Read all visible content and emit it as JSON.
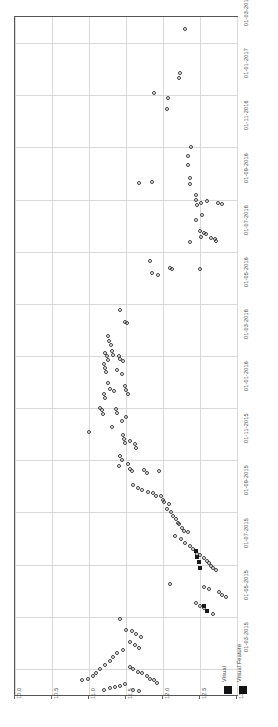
{
  "chart_data": {
    "type": "scatter",
    "title": "",
    "subtitle": "",
    "orientation": "rotated-90",
    "xlabel": "",
    "ylabel": "",
    "grid": true,
    "legend_position": "bottom-right",
    "value_axis": {
      "name": "value",
      "lim": [
        10.0,
        13.0
      ],
      "ticks": [
        10.0,
        10.5,
        11.0,
        11.5,
        12.0,
        12.5,
        13.0
      ],
      "tick_labels": [
        "10.0",
        "10.5",
        "11.0",
        "11.5",
        "12.0",
        "12.5",
        "13.0"
      ]
    },
    "date_axis": {
      "name": "date",
      "lim": [
        "01-02-2015",
        "01-04-2017"
      ],
      "ticks": [
        "01-03-2015",
        "01-05-2015",
        "01-07-2015",
        "01-09-2015",
        "01-11-2015",
        "01-01-2016",
        "01-03-2016",
        "01-05-2016",
        "01-07-2016",
        "01-09-2016",
        "01-11-2016",
        "01-01-2017",
        "01-03-2017"
      ],
      "tick_labels": [
        "01-03-2015",
        "01-05-2015",
        "01-07-2015",
        "01-09-2015",
        "01-11-2015",
        "01-01-2016",
        "01-03-2016",
        "01-05-2016",
        "01-07-2016",
        "01-09-2016",
        "01-11-2016",
        "01-01-2017",
        "01-03-2017"
      ]
    },
    "legend": [
      {
        "name": "Visual",
        "marker": "square",
        "color": "#121212"
      },
      {
        "name": "Visual Feature",
        "marker": "square",
        "color": "#121212"
      }
    ],
    "series": [
      {
        "name": "Visual",
        "marker": "open-circle",
        "color": "#3c3c3c",
        "points": [
          [
            12.3,
            0.018
          ],
          [
            12.23,
            0.082
          ],
          [
            12.22,
            0.09
          ],
          [
            11.88,
            0.112
          ],
          [
            12.07,
            0.12
          ],
          [
            12.05,
            0.135
          ],
          [
            12.38,
            0.192
          ],
          [
            12.34,
            0.205
          ],
          [
            12.34,
            0.218
          ],
          [
            12.37,
            0.238
          ],
          [
            12.37,
            0.246
          ],
          [
            11.68,
            0.245
          ],
          [
            11.85,
            0.244
          ],
          [
            12.45,
            0.262
          ],
          [
            12.44,
            0.27
          ],
          [
            12.46,
            0.278
          ],
          [
            12.52,
            0.275
          ],
          [
            12.59,
            0.272
          ],
          [
            12.74,
            0.274
          ],
          [
            12.8,
            0.276
          ],
          [
            12.53,
            0.292
          ],
          [
            12.45,
            0.3
          ],
          [
            12.5,
            0.316
          ],
          [
            12.52,
            0.324
          ],
          [
            12.55,
            0.318
          ],
          [
            12.58,
            0.32
          ],
          [
            12.65,
            0.326
          ],
          [
            12.7,
            0.328
          ],
          [
            12.71,
            0.33
          ],
          [
            12.37,
            0.332
          ],
          [
            11.83,
            0.36
          ],
          [
            11.85,
            0.378
          ],
          [
            11.93,
            0.38
          ],
          [
            12.09,
            0.37
          ],
          [
            12.12,
            0.372
          ],
          [
            12.5,
            0.372
          ],
          [
            11.42,
            0.432
          ],
          [
            11.48,
            0.45
          ],
          [
            11.52,
            0.452
          ],
          [
            11.25,
            0.47
          ],
          [
            11.27,
            0.478
          ],
          [
            11.3,
            0.484
          ],
          [
            11.22,
            0.496
          ],
          [
            11.24,
            0.5
          ],
          [
            11.25,
            0.506
          ],
          [
            11.2,
            0.512
          ],
          [
            11.21,
            0.518
          ],
          [
            11.23,
            0.524
          ],
          [
            11.31,
            0.492
          ],
          [
            11.33,
            0.498
          ],
          [
            11.4,
            0.5
          ],
          [
            11.42,
            0.505
          ],
          [
            11.46,
            0.508
          ],
          [
            11.38,
            0.52
          ],
          [
            11.44,
            0.526
          ],
          [
            11.26,
            0.54
          ],
          [
            11.28,
            0.548
          ],
          [
            11.34,
            0.552
          ],
          [
            11.2,
            0.556
          ],
          [
            11.22,
            0.562
          ],
          [
            11.48,
            0.544
          ],
          [
            11.5,
            0.55
          ],
          [
            11.53,
            0.556
          ],
          [
            11.15,
            0.576
          ],
          [
            11.17,
            0.58
          ],
          [
            11.19,
            0.586
          ],
          [
            11.36,
            0.578
          ],
          [
            11.38,
            0.584
          ],
          [
            11.5,
            0.59
          ],
          [
            11.44,
            0.596
          ],
          [
            11.31,
            0.604
          ],
          [
            11.0,
            0.612
          ],
          [
            11.46,
            0.616
          ],
          [
            11.47,
            0.622
          ],
          [
            11.49,
            0.628
          ],
          [
            11.55,
            0.626
          ],
          [
            11.62,
            0.63
          ],
          [
            11.63,
            0.636
          ],
          [
            11.42,
            0.648
          ],
          [
            11.44,
            0.654
          ],
          [
            11.4,
            0.662
          ],
          [
            11.53,
            0.66
          ],
          [
            11.56,
            0.666
          ],
          [
            11.58,
            0.67
          ],
          [
            11.74,
            0.668
          ],
          [
            11.78,
            0.672
          ],
          [
            11.95,
            0.67
          ],
          [
            11.6,
            0.69
          ],
          [
            11.66,
            0.694
          ],
          [
            11.72,
            0.698
          ],
          [
            11.8,
            0.7
          ],
          [
            11.86,
            0.702
          ],
          [
            11.9,
            0.706
          ],
          [
            11.97,
            0.706
          ],
          [
            12.0,
            0.712
          ],
          [
            12.02,
            0.716
          ],
          [
            12.08,
            0.718
          ],
          [
            12.05,
            0.726
          ],
          [
            12.11,
            0.73
          ],
          [
            12.13,
            0.736
          ],
          [
            12.18,
            0.74
          ],
          [
            12.2,
            0.746
          ],
          [
            12.22,
            0.748
          ],
          [
            12.25,
            0.754
          ],
          [
            12.28,
            0.758
          ],
          [
            12.34,
            0.76
          ],
          [
            12.16,
            0.766
          ],
          [
            12.24,
            0.77
          ],
          [
            12.3,
            0.776
          ],
          [
            12.36,
            0.78
          ],
          [
            12.4,
            0.784
          ],
          [
            12.44,
            0.788
          ],
          [
            12.46,
            0.792
          ],
          [
            12.5,
            0.794
          ],
          [
            12.55,
            0.798
          ],
          [
            12.6,
            0.802
          ],
          [
            12.62,
            0.806
          ],
          [
            12.65,
            0.81
          ],
          [
            12.68,
            0.812
          ],
          [
            12.72,
            0.816
          ],
          [
            12.1,
            0.836
          ],
          [
            12.55,
            0.84
          ],
          [
            12.62,
            0.844
          ],
          [
            12.75,
            0.848
          ],
          [
            12.8,
            0.852
          ],
          [
            12.85,
            0.856
          ],
          [
            12.45,
            0.864
          ],
          [
            12.5,
            0.868
          ],
          [
            12.55,
            0.872
          ],
          [
            12.6,
            0.876
          ],
          [
            12.68,
            0.88
          ],
          [
            11.42,
            0.888
          ],
          [
            11.5,
            0.904
          ],
          [
            11.58,
            0.906
          ],
          [
            11.64,
            0.91
          ],
          [
            11.7,
            0.914
          ],
          [
            11.55,
            0.922
          ],
          [
            11.62,
            0.926
          ],
          [
            11.68,
            0.93
          ],
          [
            11.46,
            0.934
          ],
          [
            11.38,
            0.938
          ],
          [
            11.33,
            0.944
          ],
          [
            11.28,
            0.95
          ],
          [
            11.22,
            0.956
          ],
          [
            11.15,
            0.962
          ],
          [
            11.1,
            0.968
          ],
          [
            11.05,
            0.972
          ],
          [
            10.98,
            0.976
          ],
          [
            10.9,
            0.978
          ],
          [
            11.55,
            0.958
          ],
          [
            11.6,
            0.962
          ],
          [
            11.66,
            0.966
          ],
          [
            11.72,
            0.968
          ],
          [
            11.78,
            0.972
          ],
          [
            11.82,
            0.976
          ],
          [
            11.88,
            0.978
          ],
          [
            11.92,
            0.982
          ],
          [
            11.48,
            0.984
          ],
          [
            11.42,
            0.986
          ],
          [
            11.35,
            0.988
          ],
          [
            11.28,
            0.99
          ],
          [
            11.2,
            0.992
          ],
          [
            11.6,
            0.992
          ],
          [
            11.68,
            0.994
          ]
        ]
      },
      {
        "name": "Visual Feature",
        "marker": "filled-square",
        "color": "#1a1a1a",
        "points": [
          [
            12.44,
            0.788
          ],
          [
            12.46,
            0.796
          ],
          [
            12.48,
            0.804
          ],
          [
            12.5,
            0.812
          ],
          [
            12.55,
            0.868
          ],
          [
            12.6,
            0.876
          ]
        ]
      }
    ]
  }
}
